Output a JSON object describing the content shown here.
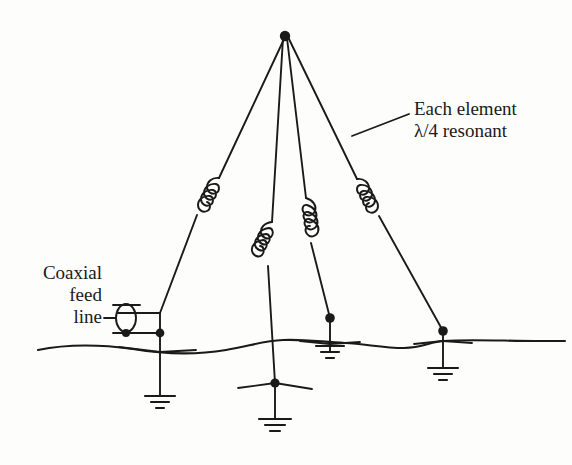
{
  "figure": {
    "type": "schematic-diagram",
    "background_color": "#fdfdfb",
    "line_color": "#1a1a1a",
    "width": 572,
    "height": 465
  },
  "labels": {
    "coaxial_feed": {
      "line1": "Coaxial",
      "line2": "feed",
      "line3": "line"
    },
    "each_element": {
      "line1": "Each element",
      "line2": "λ/4 resonant"
    }
  },
  "components": {
    "apex": {
      "name": "common-apex-junction",
      "x": 285,
      "y": 36
    },
    "elements": [
      {
        "name": "element-left",
        "has_coil": true,
        "base_x": 160,
        "base_y": 313,
        "grounded": true
      },
      {
        "name": "element-center-left",
        "has_coil": true,
        "base_x": 275,
        "base_y": 383,
        "grounded": true
      },
      {
        "name": "element-center-right",
        "has_coil": true,
        "base_x": 330,
        "base_y": 318,
        "grounded": true
      },
      {
        "name": "element-right",
        "has_coil": true,
        "base_x": 443,
        "base_y": 331,
        "grounded": true
      }
    ],
    "feed": {
      "name": "coaxial-feed-symbol",
      "x": 126,
      "y": 318,
      "junction_x": 160,
      "junction_y": 333
    },
    "ground_line": {
      "name": "earth-terrain-line",
      "x_start": 38,
      "x_end": 565,
      "y_nominal": 345
    },
    "ground_symbols": [
      {
        "name": "ground-symbol-left",
        "x": 160,
        "y": 400
      },
      {
        "name": "ground-symbol-center",
        "x": 275,
        "y": 422
      },
      {
        "name": "ground-symbol-center-right",
        "x": 330,
        "y": 340
      },
      {
        "name": "ground-symbol-right",
        "x": 443,
        "y": 372
      }
    ],
    "leader_line": {
      "name": "each-element-leader-line",
      "from_x": 352,
      "from_y": 136,
      "to_x": 409,
      "to_y": 114
    }
  }
}
